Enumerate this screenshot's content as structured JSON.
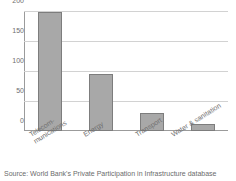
{
  "chart_data": {
    "type": "bar",
    "title": "",
    "title_note": "title row is cropped off the top edge of the screenshot and is illegible",
    "xlabel": "",
    "ylabel": "",
    "categories": [
      "Telecom-\nmunications",
      "Energy",
      "Transport",
      "Water & sanitation"
    ],
    "values": [
      200,
      96,
      30,
      12
    ],
    "ylim": [
      0,
      200
    ],
    "yticks": [
      0,
      50,
      100,
      150,
      200
    ],
    "ytick_labels": [
      "0",
      "50",
      "100",
      "150",
      "200"
    ],
    "grid": true,
    "grid_axis": "y",
    "legend": false,
    "bar_color": "#a8a8a8",
    "bar_border_color": "#7d7d7d",
    "gridline_color": "#d2d2d2",
    "axis_color": "#9b9b9b",
    "label_rotation_deg": -32
  },
  "axis": {
    "ytick_0": "0",
    "ytick_1": "50",
    "ytick_2": "100",
    "ytick_3": "150",
    "ytick_4": "200"
  },
  "categories": {
    "c0": "Telecom-\nmunications",
    "c1": "Energy",
    "c2": "Transport",
    "c3": "Water & sanitation"
  },
  "footer": {
    "source": "Source: World Bank's Private Participation in Infrastructure database"
  }
}
